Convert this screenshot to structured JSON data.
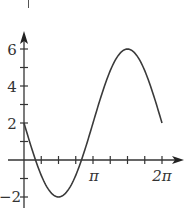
{
  "chart_data": {
    "type": "line",
    "title": "",
    "xlabel": "",
    "ylabel": "",
    "function": "y = 2 - 4 sin(x)",
    "xlim": [
      0,
      6.2832
    ],
    "ylim": [
      -2,
      6
    ],
    "x_ticks": [
      "π/4",
      "π/2",
      "3π/4",
      "π",
      "5π/4",
      "3π/2",
      "7π/4",
      "2π"
    ],
    "x_tick_labels": [
      "π",
      "2π"
    ],
    "y_ticks": [
      -2,
      -1,
      1,
      2,
      3,
      4,
      5,
      6
    ],
    "y_tick_labels": [
      "-2",
      "2",
      "4",
      "6"
    ],
    "grid": false,
    "legend": null,
    "series": [
      {
        "name": "curve",
        "x": [
          0,
          0.7854,
          1.5708,
          2.3562,
          3.1416,
          3.927,
          4.7124,
          5.4978,
          6.2832
        ],
        "values": [
          2,
          -0.83,
          -2,
          -0.83,
          2,
          4.83,
          6,
          4.83,
          2
        ]
      }
    ],
    "key_points": {
      "start": [
        0,
        2
      ],
      "minimum": [
        "π/2",
        -2
      ],
      "maximum": [
        "3π/2",
        6
      ],
      "end": [
        "2π",
        2
      ]
    }
  },
  "labels": {
    "y6": "6",
    "y4": "4",
    "y2": "2",
    "yneg2": "−2",
    "xpi": "π",
    "x2pi": "2π"
  },
  "style": {
    "line_color": "#3a3a3a",
    "axis_color": "#333333"
  }
}
